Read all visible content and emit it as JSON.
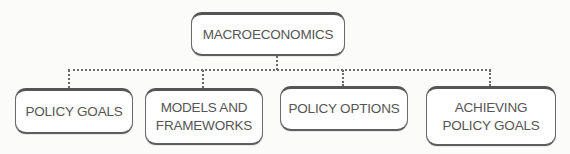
{
  "diagram": {
    "type": "hierarchy",
    "root": {
      "label": "MACROECONOMICS"
    },
    "children": [
      {
        "label": "POLICY GOALS"
      },
      {
        "label": "MODELS AND\nFRAMEWORKS"
      },
      {
        "label": "POLICY OPTIONS"
      },
      {
        "label": "ACHIEVING\nPOLICY GOALS"
      }
    ],
    "connector_style": "dotted",
    "colors": {
      "border": "#555555",
      "text": "#555555",
      "background": "#ffffff"
    }
  }
}
